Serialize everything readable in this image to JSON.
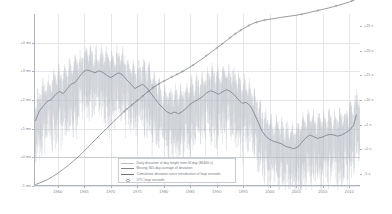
{
  "chart_data": {
    "type": "line",
    "title": "",
    "xlabel": "",
    "ylabel_left": "milliseconds",
    "ylabel_right": "seconds",
    "grid": true,
    "legend_position": "bottom-center",
    "xlim": [
      1955.5,
      2017.0
    ],
    "xticks": [
      1960,
      1965,
      1970,
      1975,
      1980,
      1985,
      1990,
      1995,
      2000,
      2005,
      2010,
      2015
    ],
    "xticklabels": [
      "1960",
      "1965",
      "1970",
      "1975",
      "1980",
      "1985",
      "1990",
      "1995",
      "2000",
      "2005",
      "2010",
      "2015"
    ],
    "ylim_left": [
      -1.0,
      5.0
    ],
    "yticks_left": [
      -1,
      0,
      1,
      2,
      3,
      4
    ],
    "yticklabels_left": [
      "-1 ms",
      "+0 ms",
      "+1 ms",
      "+2 ms",
      "+3 ms",
      "+4 ms"
    ],
    "ylim_right": [
      -7.5,
      27.5
    ],
    "yticks_right": [
      -5,
      0,
      5,
      10,
      15,
      20,
      25
    ],
    "yticklabels_right": [
      "-5 s",
      "+0 s",
      "+5 s",
      "+10 s",
      "+15 s",
      "+20 s",
      "+25 s"
    ],
    "series": [
      {
        "name": "daily_deviation",
        "label": "Daily deviation of day length from SI day (86400 s)",
        "color": "#b9bec6",
        "style": "vertical-spikes",
        "axis": "left",
        "unit": "ms"
      },
      {
        "name": "moving_average",
        "label": "Moving 365-day average of deviation",
        "color": "#7e848d",
        "style": "line",
        "axis": "left",
        "unit": "ms",
        "x": [
          1955.8,
          1956.5,
          1957.3,
          1958.0,
          1958.8,
          1959.5,
          1960.3,
          1961.0,
          1961.8,
          1962.5,
          1963.3,
          1964.0,
          1964.8,
          1965.5,
          1966.3,
          1967.0,
          1967.8,
          1968.5,
          1969.3,
          1970.0,
          1970.8,
          1971.5,
          1972.3,
          1973.0,
          1973.8,
          1974.5,
          1975.3,
          1976.0,
          1976.8,
          1977.5,
          1978.3,
          1979.0,
          1979.8,
          1980.5,
          1981.3,
          1982.0,
          1982.8,
          1983.5,
          1984.3,
          1985.0,
          1985.8,
          1986.5,
          1987.3,
          1988.0,
          1988.8,
          1989.5,
          1990.3,
          1991.0,
          1991.8,
          1992.5,
          1993.3,
          1994.0,
          1994.8,
          1995.5,
          1996.3,
          1997.0,
          1997.8,
          1998.5,
          1999.3,
          2000.0,
          2000.8,
          2001.5,
          2002.3,
          2003.0,
          2003.8,
          2004.5,
          2005.3,
          2006.0,
          2006.8,
          2007.5,
          2008.3,
          2009.0,
          2009.8,
          2010.5,
          2011.3,
          2012.0,
          2012.8,
          2013.5,
          2014.3,
          2015.0,
          2015.8,
          2016.3
        ],
        "values": [
          1.28,
          1.62,
          1.8,
          1.95,
          2.02,
          2.18,
          2.3,
          2.22,
          2.4,
          2.55,
          2.62,
          2.8,
          2.98,
          3.05,
          3.0,
          2.95,
          3.02,
          2.96,
          2.85,
          2.78,
          2.88,
          2.95,
          2.86,
          2.7,
          2.55,
          2.4,
          2.48,
          2.55,
          2.42,
          2.25,
          2.05,
          1.88,
          1.72,
          1.6,
          1.52,
          1.58,
          1.52,
          1.6,
          1.72,
          1.86,
          1.95,
          2.02,
          2.12,
          2.24,
          2.32,
          2.28,
          2.2,
          2.28,
          2.36,
          2.3,
          2.18,
          2.02,
          1.88,
          1.92,
          1.8,
          1.55,
          1.22,
          0.92,
          0.72,
          0.62,
          0.55,
          0.52,
          0.46,
          0.38,
          0.34,
          0.3,
          0.36,
          0.52,
          0.68,
          0.78,
          0.72,
          0.66,
          0.7,
          0.76,
          0.8,
          0.78,
          0.74,
          0.78,
          0.86,
          0.94,
          1.12,
          1.48
        ]
      },
      {
        "name": "cumulative_deviation",
        "label": "Cumulative deviation since introduction of leap seconds",
        "color": "#6b7179",
        "style": "line",
        "axis": "right",
        "unit": "s",
        "x": [
          1955.8,
          1957.0,
          1958.0,
          1959.0,
          1960.0,
          1961.0,
          1962.0,
          1963.0,
          1964.0,
          1965.0,
          1966.0,
          1967.0,
          1968.0,
          1969.0,
          1970.0,
          1971.0,
          1972.0,
          1973.0,
          1974.0,
          1975.0,
          1976.0,
          1977.0,
          1978.0,
          1979.0,
          1980.0,
          1981.0,
          1982.0,
          1983.0,
          1984.0,
          1985.0,
          1986.0,
          1987.0,
          1988.0,
          1989.0,
          1990.0,
          1991.0,
          1992.0,
          1993.0,
          1994.0,
          1995.0,
          1996.0,
          1997.0,
          1998.0,
          1999.0,
          2000.0,
          2001.0,
          2002.0,
          2003.0,
          2004.0,
          2005.0,
          2006.0,
          2007.0,
          2008.0,
          2009.0,
          2010.0,
          2011.0,
          2012.0,
          2013.0,
          2014.0,
          2015.0,
          2016.0,
          2016.8
        ],
        "values": [
          -7.2,
          -6.7,
          -6.2,
          -5.6,
          -4.9,
          -4.1,
          -3.25,
          -2.35,
          -1.4,
          -0.35,
          0.75,
          1.85,
          2.95,
          4.0,
          5.05,
          6.1,
          7.15,
          8.15,
          9.05,
          9.9,
          10.8,
          11.7,
          12.55,
          13.25,
          13.85,
          14.4,
          14.95,
          15.5,
          16.1,
          16.75,
          17.45,
          18.2,
          19.0,
          19.8,
          20.6,
          21.4,
          22.25,
          23.1,
          23.85,
          24.55,
          25.15,
          25.65,
          26.0,
          26.25,
          26.45,
          26.6,
          26.8,
          26.95,
          27.1,
          27.25,
          27.45,
          27.7,
          27.95,
          28.2,
          28.45,
          28.7,
          29.0,
          29.3,
          29.6,
          29.95,
          30.4,
          30.8
        ]
      },
      {
        "name": "utc_leap_seconds",
        "label": "UTC leap seconds",
        "color": "#8d939b",
        "style": "marker",
        "axis": "right",
        "unit": "s",
        "x": [
          1972.5,
          1973.0,
          1974.0,
          1975.0,
          1976.0,
          1977.0,
          1978.0,
          1979.0,
          1980.0,
          1981.5,
          1982.5,
          1983.5,
          1985.5,
          1988.0,
          1990.0,
          1991.0,
          1992.5,
          1993.5,
          1994.5,
          1996.0,
          1997.5,
          1999.0,
          2006.0,
          2009.0,
          2012.5,
          2015.5,
          2017.0
        ]
      }
    ]
  },
  "legend": {
    "items": [
      {
        "label": "Daily deviation of day length from SI day (86400 s)",
        "swatch": "line-light",
        "color": "#b9bec6"
      },
      {
        "label": "Moving 365-day average of deviation",
        "swatch": "line-mid",
        "color": "#7e848d"
      },
      {
        "label": "Cumulative deviation since introduction of leap seconds",
        "swatch": "line-dark",
        "color": "#6b7179"
      },
      {
        "label": "UTC leap seconds",
        "swatch": "marker",
        "color": "#8d939b"
      }
    ]
  },
  "colors": {
    "background": "#ffffff",
    "grid": "#e3e6ea",
    "grid_major": "#c9ced6",
    "axis": "#aeb4bd",
    "tick_text": "#7a8089",
    "legend_border": "#c8cdd4",
    "legend_text": "#6f757e"
  }
}
